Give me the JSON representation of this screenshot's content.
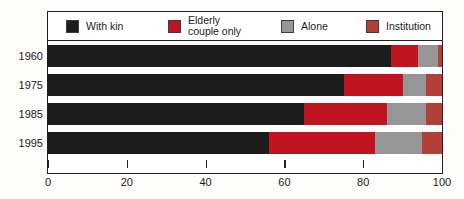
{
  "chart_data": {
    "type": "bar",
    "orientation": "horizontal",
    "stacked": true,
    "stacked_percent": true,
    "title": "",
    "subtitle": "",
    "xlabel": "",
    "ylabel": "",
    "xlim": [
      0,
      100
    ],
    "xticks": [
      0,
      20,
      40,
      60,
      80,
      100
    ],
    "xticklabels": [
      "0",
      "20",
      "40",
      "60",
      "80",
      "100"
    ],
    "grid": false,
    "legend_position": "top-inside",
    "categories": [
      "1960",
      "1975",
      "1985",
      "1995"
    ],
    "series": [
      {
        "name": "With kin",
        "color": "#1c1c1c",
        "values": [
          87,
          75,
          65,
          56
        ]
      },
      {
        "name": "Elderly\ncouple only",
        "color": "#c01520",
        "values": [
          7,
          15,
          21,
          27
        ]
      },
      {
        "name": "Alone",
        "color": "#969696",
        "values": [
          5,
          6,
          10,
          12
        ]
      },
      {
        "name": "Institution",
        "color": "#b04038",
        "values": [
          1,
          4,
          4,
          5
        ]
      }
    ],
    "legend_entries": [
      {
        "label": "With kin",
        "color": "#1c1c1c"
      },
      {
        "label": "Elderly\ncouple only",
        "color": "#c01520"
      },
      {
        "label": "Alone",
        "color": "#969696"
      },
      {
        "label": "Institution",
        "color": "#b04038"
      }
    ]
  },
  "colors": {
    "with_kin": "#1c1c1c",
    "elderly_couple_only": "#c01520",
    "alone": "#969696",
    "institution": "#b04038",
    "frame": "#23211f",
    "text": "#1a1a1a",
    "background": "#fdfdfc"
  }
}
